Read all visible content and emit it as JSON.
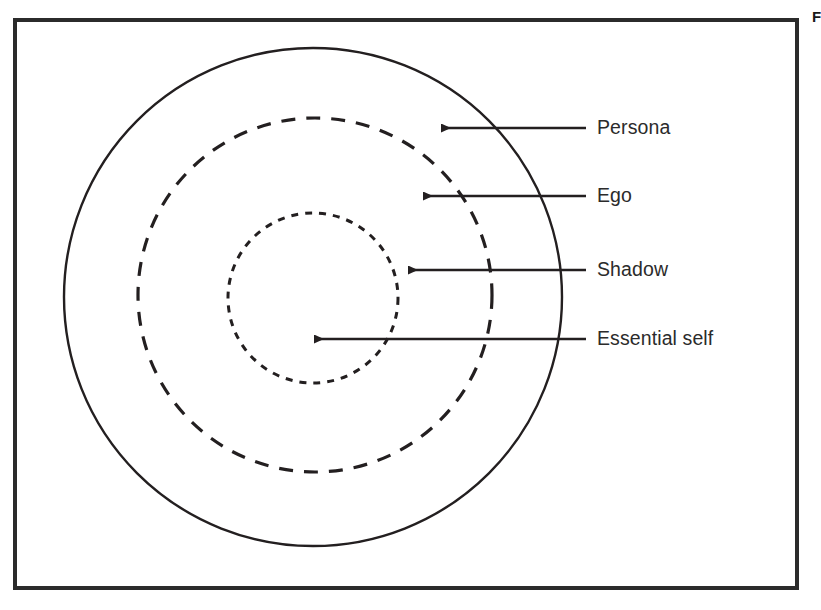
{
  "figure": {
    "caption_fragment": "Figure",
    "border_color": "#2b2b2b",
    "background": "#ffffff",
    "stroke_color": "#231f20"
  },
  "diagram": {
    "type": "concentric-circles",
    "center": {
      "x": 313,
      "y": 297
    },
    "rings": [
      {
        "name": "persona-ring",
        "label": "Persona",
        "radius": 249,
        "line_style": "solid",
        "stroke_width": 2.4
      },
      {
        "name": "ego-ring",
        "label": "Ego",
        "radius": 177,
        "line_style": "dashed",
        "stroke_width": 3.2,
        "dash_pattern": "14 11"
      },
      {
        "name": "shadow-ring",
        "label": "Shadow",
        "radius": 85,
        "line_style": "dotted",
        "stroke_width": 3.0,
        "dash_pattern": "7 7"
      },
      {
        "name": "essential-self-core",
        "label": "Essential self",
        "radius": 0,
        "line_style": "none",
        "stroke_width": 0
      }
    ],
    "callouts": [
      {
        "name": "persona",
        "label": "Persona",
        "tip_x": 437,
        "tip_y": 128,
        "tail_x": 586,
        "tail_y": 128
      },
      {
        "name": "ego",
        "label": "Ego",
        "tip_x": 419,
        "tip_y": 196,
        "tail_x": 586,
        "tail_y": 196
      },
      {
        "name": "shadow",
        "label": "Shadow",
        "tip_x": 404,
        "tip_y": 270,
        "tail_x": 586,
        "tail_y": 270
      },
      {
        "name": "essential-self",
        "label": "Essential self",
        "tip_x": 310,
        "tip_y": 339,
        "tail_x": 586,
        "tail_y": 339
      }
    ]
  },
  "labels": {
    "persona": "Persona",
    "ego": "Ego",
    "shadow": "Shadow",
    "essential_self": "Essential self"
  }
}
